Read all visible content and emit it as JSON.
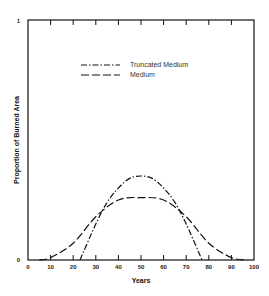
{
  "chart_data": {
    "type": "line",
    "title": "",
    "xlabel": "Years",
    "ylabel": "Proportion of Burned Area",
    "xlim": [
      0,
      100
    ],
    "ylim": [
      0,
      1
    ],
    "x_ticks": [
      "0",
      "10",
      "20",
      "30",
      "40",
      "50",
      "60",
      "70",
      "80",
      "90",
      "100"
    ],
    "y_ticks": [
      "0",
      "1"
    ],
    "grid": false,
    "legend_position": "upper center",
    "series": [
      {
        "name": "Truncated Medium",
        "style": "dash-dot",
        "x": [
          23,
          30,
          35,
          40,
          45,
          50,
          55,
          60,
          65,
          70,
          77
        ],
        "y": [
          0.0,
          0.15,
          0.24,
          0.3,
          0.34,
          0.35,
          0.34,
          0.3,
          0.24,
          0.15,
          0.0
        ]
      },
      {
        "name": "Medium",
        "style": "dashed",
        "x": [
          5,
          10,
          20,
          30,
          40,
          50,
          60,
          70,
          80,
          90,
          97
        ],
        "y": [
          0.0,
          0.01,
          0.07,
          0.18,
          0.25,
          0.26,
          0.25,
          0.18,
          0.07,
          0.01,
          0.0
        ]
      }
    ]
  },
  "legend": {
    "items": [
      {
        "label": "Truncated Medium"
      },
      {
        "label": "Medium"
      }
    ]
  },
  "axes": {
    "xlabel": "Years",
    "ylabel": "Proportion of Burned Area",
    "y_top": "1",
    "y_bottom": "0"
  }
}
